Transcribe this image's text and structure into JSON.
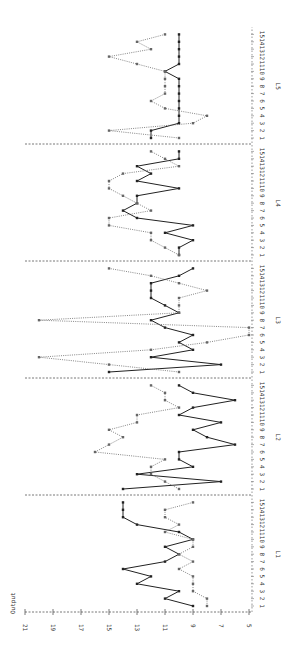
{
  "chart_data": {
    "type": "line",
    "orientation": "rotated-90-ccw",
    "title": "",
    "ylabel": "Output",
    "xlabel": "",
    "y_ticks": [
      21,
      19,
      17,
      15,
      13,
      11,
      9,
      7,
      5
    ],
    "ylim": [
      5,
      21
    ],
    "segments": [
      "L1",
      "L2",
      "L3",
      "L4",
      "L5"
    ],
    "x_tick_labels": [
      "1",
      "2",
      "3",
      "4",
      "5",
      "6",
      "7",
      "8",
      "9",
      "10",
      "11",
      "12",
      "13",
      "14",
      "15"
    ],
    "series": [
      {
        "name": "solid",
        "style": "solid",
        "color": "#222222",
        "values": {
          "L1": [
            9,
            11,
            10,
            13,
            12,
            14,
            11,
            10,
            11,
            9,
            10,
            13,
            14,
            14,
            14
          ],
          "L2": [
            14,
            7,
            13,
            9,
            10,
            10,
            6,
            8,
            9,
            7,
            10,
            9,
            6,
            9,
            10
          ],
          "L3": [
            15,
            7,
            12,
            9,
            10,
            9,
            11,
            12,
            10,
            11,
            12,
            12,
            12,
            10,
            9
          ],
          "L4": [
            10,
            10,
            9,
            11,
            9,
            13,
            14,
            13,
            13,
            10,
            13,
            12,
            13,
            10,
            10
          ],
          "L5": [
            12,
            12,
            10,
            10,
            10,
            10,
            10,
            10,
            10,
            11,
            10,
            10,
            10,
            10,
            10
          ]
        }
      },
      {
        "name": "dotted",
        "style": "dotted",
        "color": "#666666",
        "values": {
          "L1": [
            8,
            8,
            9,
            9,
            9,
            10,
            9,
            10,
            9,
            9,
            11,
            10,
            11,
            11,
            9
          ],
          "L2": [
            10,
            11,
            12,
            12,
            11,
            16,
            15,
            14,
            15,
            13,
            13,
            10,
            11,
            11,
            12
          ],
          "L3": [
            10,
            15,
            20,
            12,
            8,
            5,
            5,
            20,
            10,
            10,
            10,
            8,
            10,
            12,
            15
          ],
          "L4": [
            10,
            11,
            12,
            12,
            15,
            15,
            12,
            13,
            14,
            15,
            15,
            14,
            10,
            11,
            12
          ],
          "L5": [
            10,
            15,
            9,
            8,
            11,
            12,
            11,
            11,
            11,
            11,
            13,
            15,
            12,
            13,
            11
          ]
        }
      }
    ],
    "grid": false,
    "legend": "none"
  }
}
